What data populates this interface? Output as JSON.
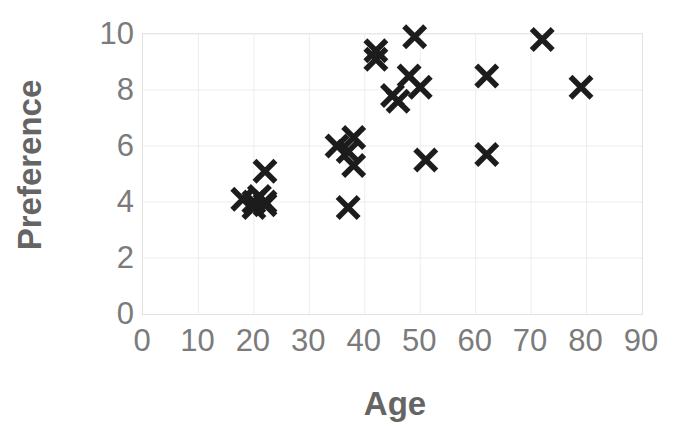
{
  "chart_data": {
    "type": "scatter",
    "title": "",
    "xlabel": "Age",
    "ylabel": "Preference",
    "xlim": [
      0,
      90
    ],
    "ylim": [
      0,
      10
    ],
    "xticks": [
      0,
      10,
      20,
      30,
      40,
      50,
      60,
      70,
      80,
      90
    ],
    "yticks": [
      0,
      2,
      4,
      6,
      8,
      10
    ],
    "grid": true,
    "legend": null,
    "marker": "x",
    "marker_color": "#1c1c1c",
    "grid_color": "#ededed",
    "axis_label_color": "#656565",
    "tick_label_color": "#7b7b7b",
    "series": [
      {
        "name": "Preference vs Age",
        "points": [
          {
            "x": 18,
            "y": 4.1
          },
          {
            "x": 20,
            "y": 4.0
          },
          {
            "x": 20,
            "y": 3.8
          },
          {
            "x": 21,
            "y": 4.2
          },
          {
            "x": 22,
            "y": 4.0
          },
          {
            "x": 22,
            "y": 3.9
          },
          {
            "x": 22,
            "y": 5.1
          },
          {
            "x": 35,
            "y": 6.0
          },
          {
            "x": 37,
            "y": 5.8
          },
          {
            "x": 37,
            "y": 3.8
          },
          {
            "x": 38,
            "y": 6.3
          },
          {
            "x": 38,
            "y": 5.3
          },
          {
            "x": 42,
            "y": 9.4
          },
          {
            "x": 42,
            "y": 9.1
          },
          {
            "x": 45,
            "y": 7.8
          },
          {
            "x": 46,
            "y": 7.6
          },
          {
            "x": 48,
            "y": 8.5
          },
          {
            "x": 49,
            "y": 9.9
          },
          {
            "x": 50,
            "y": 8.1
          },
          {
            "x": 51,
            "y": 5.5
          },
          {
            "x": 62,
            "y": 8.5
          },
          {
            "x": 62,
            "y": 5.7
          },
          {
            "x": 72,
            "y": 9.8
          },
          {
            "x": 79,
            "y": 8.1
          }
        ]
      }
    ]
  }
}
